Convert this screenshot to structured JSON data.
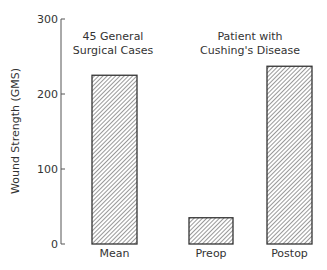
{
  "chart_data": {
    "type": "bar",
    "title": "",
    "ylabel": "Wound Strength (GMS)",
    "xlabel": "",
    "ylim": [
      0,
      300
    ],
    "yticks": [
      0,
      100,
      200,
      300
    ],
    "grid": false,
    "categories": [
      "Mean",
      "Preop",
      "Postop"
    ],
    "values": [
      225,
      35,
      237
    ],
    "groups": [
      {
        "label_lines": [
          "45 General",
          "Surgical Cases"
        ],
        "categories": [
          "Mean"
        ]
      },
      {
        "label_lines": [
          "Patient with",
          "Cushing's Disease"
        ],
        "categories": [
          "Preop",
          "Postop"
        ]
      }
    ],
    "fill": "diagonal-hatch",
    "colors": {
      "stroke": "#333333",
      "hatch": "#444444",
      "background": "#ffffff"
    }
  }
}
